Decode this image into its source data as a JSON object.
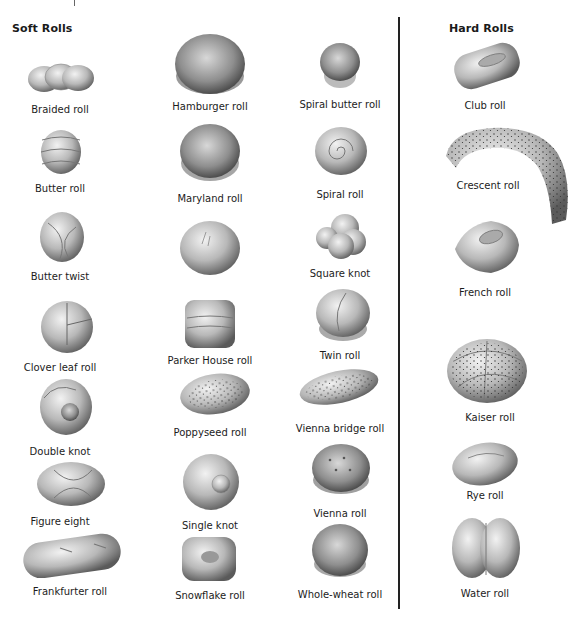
{
  "sections": {
    "soft": {
      "title": "Soft Rolls",
      "items": [
        {
          "label": "Braided roll"
        },
        {
          "label": "Butter roll"
        },
        {
          "label": "Butter twist"
        },
        {
          "label": "Clover leaf roll"
        },
        {
          "label": "Double knot"
        },
        {
          "label": "Figure eight"
        },
        {
          "label": "Frankfurter roll"
        },
        {
          "label": "Hamburger roll"
        },
        {
          "label": "Maryland roll"
        },
        {
          "label": "Pan roll"
        },
        {
          "label": "Parker House roll"
        },
        {
          "label": "Poppyseed roll"
        },
        {
          "label": "Single knot"
        },
        {
          "label": "Snowflake roll"
        },
        {
          "label": "Spiral butter roll"
        },
        {
          "label": "Spiral roll"
        },
        {
          "label": "Square knot"
        },
        {
          "label": "Twin roll"
        },
        {
          "label": "Vienna bridge roll"
        },
        {
          "label": "Vienna roll"
        },
        {
          "label": "Whole-wheat roll"
        }
      ]
    },
    "hard": {
      "title": "Hard Rolls",
      "items": [
        {
          "label": "Club roll"
        },
        {
          "label": "Crescent roll"
        },
        {
          "label": "French roll"
        },
        {
          "label": "Kaiser roll"
        },
        {
          "label": "Rye roll"
        },
        {
          "label": "Water roll"
        }
      ]
    }
  }
}
